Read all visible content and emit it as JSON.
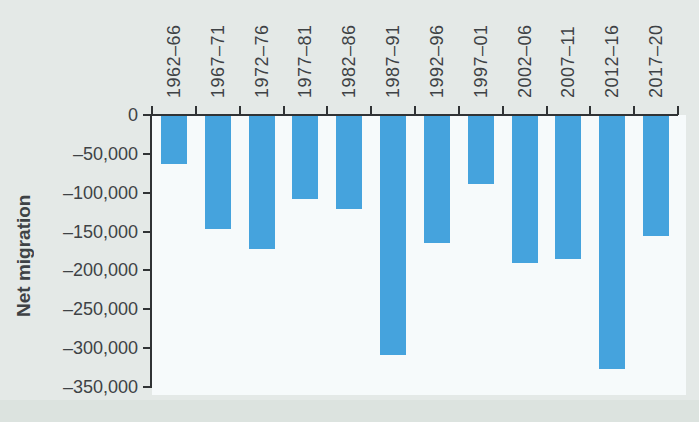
{
  "page": {
    "background": "#e4e9e7",
    "bottom_band_color": "#dce3df"
  },
  "chart_data": {
    "type": "bar",
    "title": "",
    "ylabel": "Net migration",
    "xlabel": "",
    "categories": [
      "1962–66",
      "1967–71",
      "1972–76",
      "1977–81",
      "1982–86",
      "1987–91",
      "1992–96",
      "1997–01",
      "2002–06",
      "2007–11",
      "2012–16",
      "2017–20"
    ],
    "values": [
      -62000,
      -145000,
      -171000,
      -107000,
      -120000,
      -307000,
      -164000,
      -88000,
      -189000,
      -184000,
      -326000,
      -154000
    ],
    "ylim": [
      -350000,
      0
    ],
    "ytick_step": 50000,
    "ytick_labels": [
      "0",
      "–50,000",
      "–100,000",
      "–150,000",
      "–200,000",
      "–250,000",
      "–300,000",
      "–350,000"
    ],
    "legend": "none",
    "grid": false,
    "bar_color": "#45a3dd",
    "plot_background": "#f6fafb",
    "axis_color": "#303335",
    "text_color": "#3e4245"
  }
}
